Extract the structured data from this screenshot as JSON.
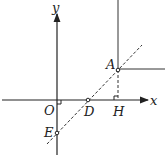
{
  "diagram": {
    "type": "coordinate-geometry",
    "axes": {
      "x_label": "x",
      "y_label": "y",
      "origin_label": "O"
    },
    "points": {
      "A": "A",
      "D": "D",
      "E": "E",
      "H": "H"
    },
    "elements": [
      "dashed line through E, D, A",
      "dashed segment AH perpendicular to x-axis",
      "right-angle marks at O and H",
      "solid vertical line above A",
      "solid horizontal line from A to the right"
    ]
  }
}
